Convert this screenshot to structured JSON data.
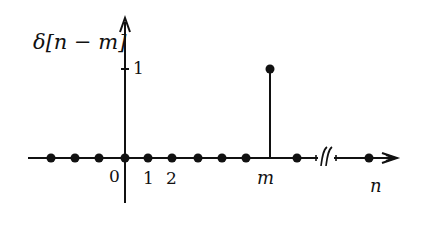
{
  "diagram": {
    "type": "discrete-time unit impulse (shifted)",
    "y_label": "δ[n − m]",
    "x_label": "n",
    "tick_labels": {
      "zero": "0",
      "one": "1",
      "two": "2",
      "m": "m"
    },
    "amplitude_label": "1",
    "impulse_location": "m",
    "impulse_value": 1,
    "break_mark": "axis break between m and n",
    "samples_zero_count_left": 3,
    "samples_zero_right_before_m": 5,
    "samples_after_m": 2
  }
}
